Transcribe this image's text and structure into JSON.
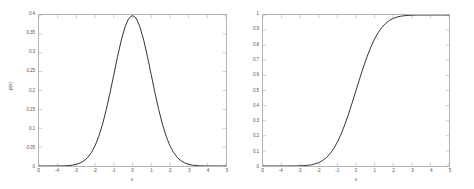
{
  "figure": {
    "background": "#ffffff",
    "axis_color": "#b4b4b4",
    "tick_color": "#b4b4b4",
    "curve_color": "#1a1a1a",
    "label_color": "#555555"
  },
  "chart_data": [
    {
      "type": "line",
      "id": "gaussian-pdf",
      "title": "",
      "xlabel": "x",
      "ylabel": "p(x)",
      "xlim": [
        -5,
        5
      ],
      "ylim": [
        0,
        0.4
      ],
      "grid": false,
      "legend": null,
      "xticks": [
        -5,
        -4,
        -3,
        -2,
        -1,
        0,
        1,
        2,
        3,
        4,
        5
      ],
      "xticklabels": [
        "-5",
        "-4",
        "-3",
        "-2",
        "-1",
        "0",
        "1",
        "2",
        "3",
        "4",
        "5"
      ],
      "yticks": [
        0,
        0.05,
        0.1,
        0.15,
        0.2,
        0.25,
        0.3,
        0.35,
        0.4
      ],
      "yticklabels": [
        "0",
        "0.05",
        "0.1",
        "0.15",
        "0.2",
        "0.25",
        "0.3",
        "0.35",
        "0.4"
      ],
      "x": [
        -5,
        -4.8,
        -4.6,
        -4.4,
        -4.2,
        -4,
        -3.8,
        -3.6,
        -3.4,
        -3.2,
        -3,
        -2.8,
        -2.6,
        -2.4,
        -2.2,
        -2,
        -1.8,
        -1.6,
        -1.4,
        -1.2,
        -1,
        -0.8,
        -0.6,
        -0.4,
        -0.2,
        0,
        0.2,
        0.4,
        0.6,
        0.8,
        1,
        1.2,
        1.4,
        1.6,
        1.8,
        2,
        2.2,
        2.4,
        2.6,
        2.8,
        3,
        3.2,
        3.4,
        3.6,
        3.8,
        4,
        4.2,
        4.4,
        4.6,
        4.8,
        5
      ],
      "y": [
        1.5e-06,
        4e-06,
        1.02e-05,
        2.49e-05,
        5.89e-05,
        0.0001338,
        0.0002919,
        0.0006119,
        0.0012322,
        0.0023841,
        0.0044318,
        0.0079155,
        0.013583,
        0.0223945,
        0.0354746,
        0.053991,
        0.0789502,
        0.1109208,
        0.1497275,
        0.1941861,
        0.2419707,
        0.2896916,
        0.3332246,
        0.3682701,
        0.3910427,
        0.3989423,
        0.3910427,
        0.3682701,
        0.3332246,
        0.2896916,
        0.2419707,
        0.1941861,
        0.1497275,
        0.1109208,
        0.0789502,
        0.053991,
        0.0354746,
        0.0223945,
        0.013583,
        0.0079155,
        0.0044318,
        0.0023841,
        0.0012322,
        0.0006119,
        0.0002919,
        0.0001338,
        5.89e-05,
        2.49e-05,
        1.02e-05,
        4e-06,
        1.5e-06
      ],
      "series_name": "standard normal pdf"
    },
    {
      "type": "line",
      "id": "gaussian-cdf",
      "title": "",
      "xlabel": "x",
      "ylabel": "P(x)",
      "xlim": [
        -5,
        5
      ],
      "ylim": [
        0,
        1
      ],
      "grid": false,
      "legend": null,
      "xticks": [
        -5,
        -4,
        -3,
        -2,
        -1,
        0,
        1,
        2,
        3,
        4,
        5
      ],
      "xticklabels": [
        "-5",
        "-4",
        "-3",
        "-2",
        "-1",
        "0",
        "1",
        "2",
        "3",
        "4",
        "5"
      ],
      "yticks": [
        0,
        0.1,
        0.2,
        0.3,
        0.4,
        0.5,
        0.6,
        0.7,
        0.8,
        0.9,
        1
      ],
      "yticklabels": [
        "0",
        "0.1",
        "0.2",
        "0.3",
        "0.4",
        "0.5",
        "0.6",
        "0.7",
        "0.8",
        "0.9",
        "1"
      ],
      "x": [
        -5,
        -4.8,
        -4.6,
        -4.4,
        -4.2,
        -4,
        -3.8,
        -3.6,
        -3.4,
        -3.2,
        -3,
        -2.8,
        -2.6,
        -2.4,
        -2.2,
        -2,
        -1.8,
        -1.6,
        -1.4,
        -1.2,
        -1,
        -0.8,
        -0.6,
        -0.4,
        -0.2,
        0,
        0.2,
        0.4,
        0.6,
        0.8,
        1,
        1.2,
        1.4,
        1.6,
        1.8,
        2,
        2.2,
        2.4,
        2.6,
        2.8,
        3,
        3.2,
        3.4,
        3.6,
        3.8,
        4,
        4.2,
        4.4,
        4.6,
        4.8,
        5
      ],
      "y": [
        3e-07,
        8e-07,
        2.1e-06,
        5.4e-06,
        1.33e-05,
        3.17e-05,
        7.23e-05,
        0.0001591,
        0.0003369,
        0.0006871,
        0.0013499,
        0.0025551,
        0.0046612,
        0.0081975,
        0.0139034,
        0.0227501,
        0.0359303,
        0.0547993,
        0.0807567,
        0.1150697,
        0.1586553,
        0.2118554,
        0.2742531,
        0.3445783,
        0.4207403,
        0.5,
        0.5792597,
        0.6554217,
        0.7257469,
        0.7881446,
        0.8413447,
        0.8849303,
        0.9192433,
        0.9452007,
        0.9640697,
        0.9772499,
        0.9860966,
        0.9918025,
        0.9953388,
        0.9974449,
        0.9986501,
        0.9993129,
        0.9996631,
        0.9998409,
        0.9999277,
        0.9999683,
        0.9999867,
        0.9999946,
        0.9999979,
        0.9999992,
        0.9999997
      ],
      "series_name": "standard normal cdf"
    }
  ]
}
